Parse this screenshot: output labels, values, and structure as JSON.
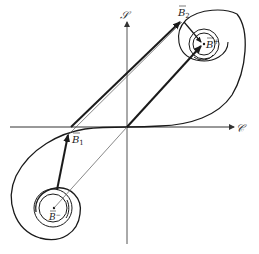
{
  "figure": {
    "type": "phase-plane diagram",
    "axes": {
      "horizontal_label": "𝒞",
      "vertical_label": "𝒮"
    },
    "points": {
      "b_plus": {
        "label": "B",
        "superscript": "+",
        "bar": true
      },
      "b_minus": {
        "label": "B",
        "superscript": "−",
        "bar": true
      },
      "b_1": {
        "label": "B",
        "subscript": "1",
        "bar": true
      },
      "b_2": {
        "label": "B",
        "subscript": "2",
        "bar": true
      }
    },
    "colors": {
      "stroke": "#1a1a1a",
      "thin_stroke": "#555555",
      "background": "#ffffff"
    }
  }
}
